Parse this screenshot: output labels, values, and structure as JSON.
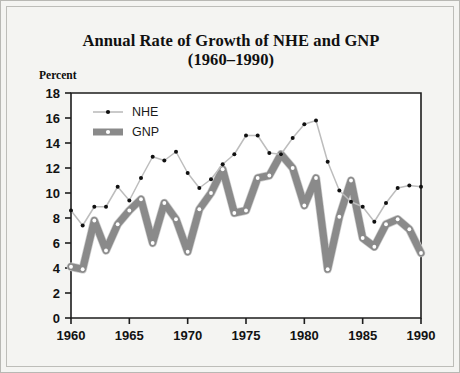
{
  "figure": {
    "title_line1": "Annual Rate of Growth of NHE and GNP",
    "title_line2": "(1960–1990)",
    "y_axis_label": "Percent",
    "nhe_legend": "NHE",
    "gnp_legend": "GNP",
    "nhe_color": "#1a1a1a",
    "gnp_color": "#8c8c8c",
    "background_color": "#f4f4f2",
    "plot_background_color": "#ffffff"
  },
  "chart_data": {
    "type": "line",
    "title": "Annual Rate of Growth of NHE and GNP (1960–1990)",
    "xlabel": "",
    "ylabel": "Percent",
    "xlim": [
      1960,
      1990
    ],
    "ylim": [
      0,
      18
    ],
    "ytick_step": 2,
    "yticks": [
      0,
      2,
      4,
      6,
      8,
      10,
      12,
      14,
      16,
      18
    ],
    "xticks": [
      1960,
      1965,
      1970,
      1975,
      1980,
      1985,
      1990
    ],
    "xtick_labels": [
      "1960",
      "1965",
      "1970",
      "1975",
      "1980",
      "1985",
      "1990"
    ],
    "ytick_labels": [
      "0",
      "2",
      "4",
      "6",
      "8",
      "10",
      "12",
      "14",
      "16",
      "18"
    ],
    "grid": false,
    "legend_position": "top-left",
    "x": [
      1960,
      1961,
      1962,
      1963,
      1964,
      1965,
      1966,
      1967,
      1968,
      1969,
      1970,
      1971,
      1972,
      1973,
      1974,
      1975,
      1976,
      1977,
      1978,
      1979,
      1980,
      1981,
      1982,
      1983,
      1984,
      1985,
      1986,
      1987,
      1988,
      1989,
      1990
    ],
    "series": [
      {
        "name": "NHE",
        "marker": "dot",
        "values": [
          8.6,
          7.4,
          8.9,
          8.9,
          10.5,
          9.4,
          11.2,
          12.9,
          12.6,
          13.3,
          11.6,
          10.4,
          11.1,
          12.3,
          13.1,
          14.6,
          14.6,
          13.2,
          13.1,
          14.4,
          15.5,
          15.8,
          12.5,
          10.2,
          9.3,
          8.9,
          7.7,
          9.2,
          10.4,
          10.6,
          10.5
        ],
        "color": "#bdbdbd",
        "marker_color": "#111111"
      },
      {
        "name": "GNP",
        "marker": "dot",
        "values": [
          4.1,
          3.9,
          7.8,
          5.4,
          7.5,
          8.6,
          9.5,
          6.0,
          9.2,
          7.9,
          5.3,
          8.7,
          10.0,
          11.9,
          8.4,
          8.6,
          11.2,
          11.4,
          13.1,
          12.0,
          9.0,
          11.2,
          3.9,
          8.1,
          11.0,
          6.4,
          5.7,
          7.5,
          7.9,
          7.1,
          5.2
        ],
        "color": "#8a8a8a",
        "marker_color": "#ffffff"
      }
    ]
  }
}
